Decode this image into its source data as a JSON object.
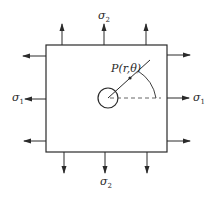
{
  "diagram": {
    "labels": {
      "sigma_top": "σ",
      "sigma_top_sub": "2",
      "sigma_bottom": "σ",
      "sigma_bottom_sub": "2",
      "sigma_left": "σ",
      "sigma_left_sub": "1",
      "sigma_right": "σ",
      "sigma_right_sub": "1",
      "point": "P(r,θ)"
    },
    "colors": {
      "stroke": "#2a2a2a",
      "dashed": "#555555",
      "background": "#ffffff"
    },
    "plate": {
      "x": 46,
      "y": 45,
      "width": 121,
      "height": 107
    },
    "hole": {
      "cx": 108,
      "cy": 98,
      "r": 10
    }
  }
}
